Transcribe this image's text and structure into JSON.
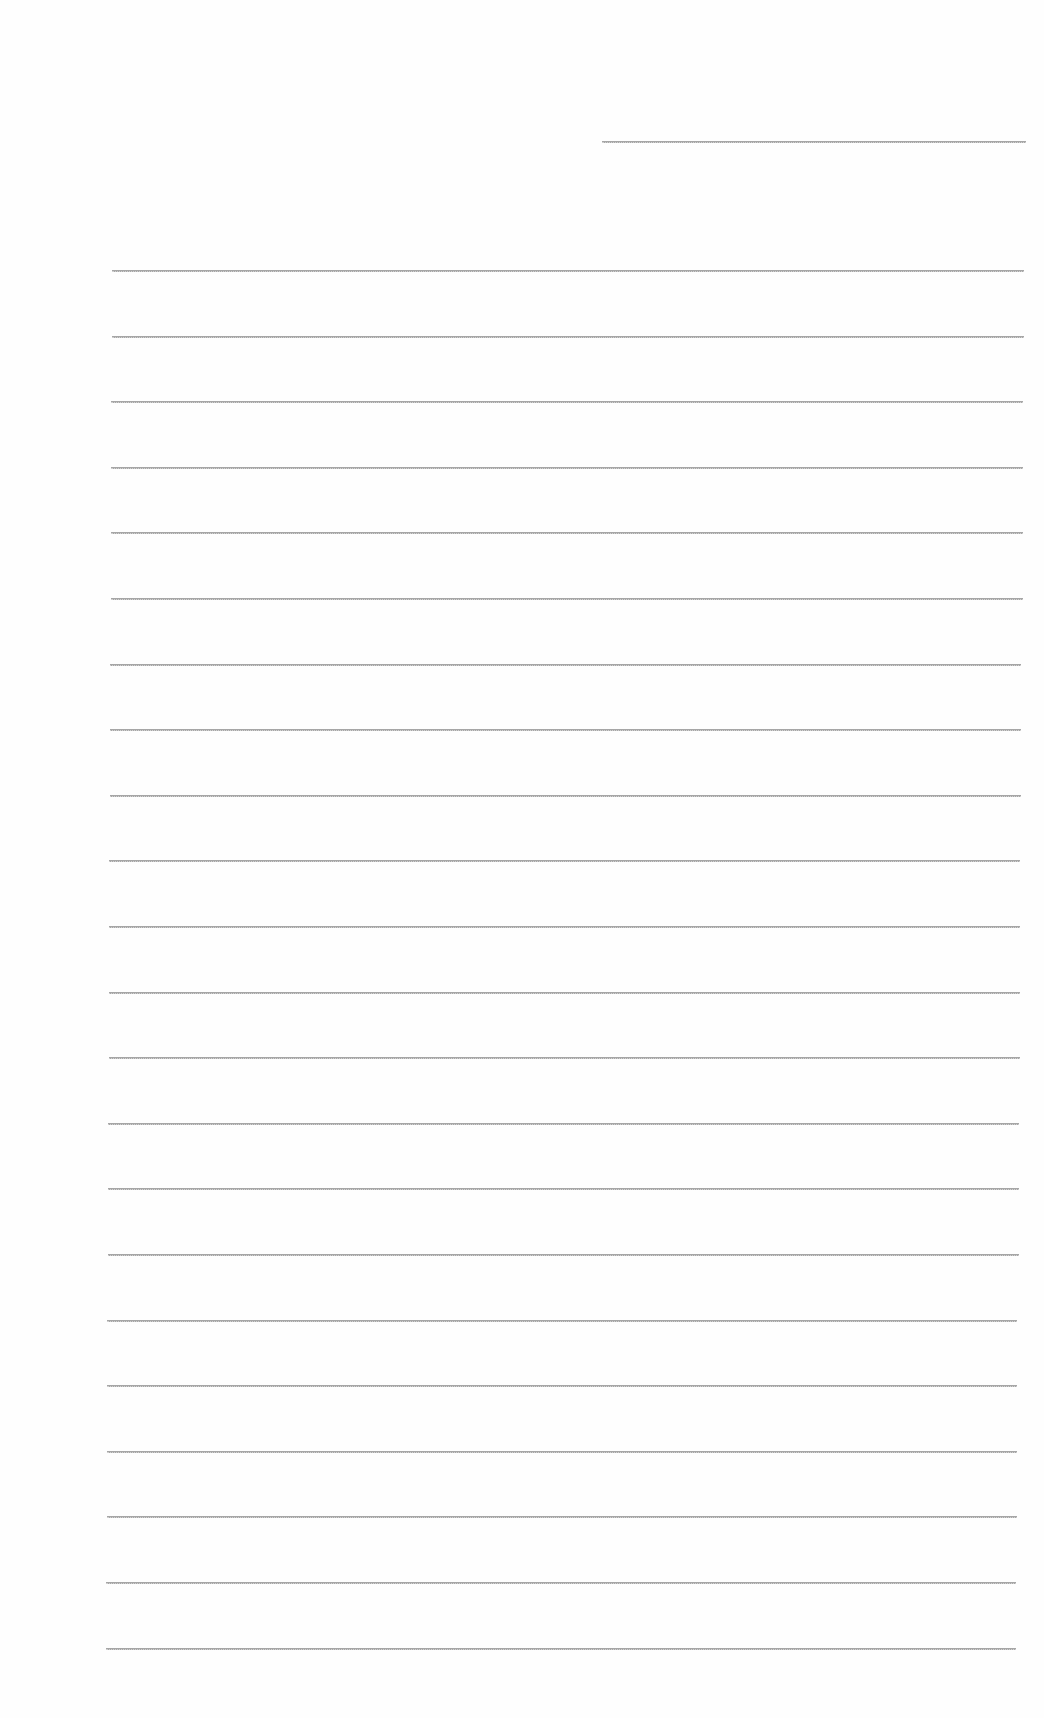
{
  "document": {
    "type": "lined-paper",
    "header_line": {
      "left": 602,
      "right": 1026,
      "y": 141
    },
    "ruled_lines": {
      "count": 22,
      "first_y": 270,
      "spacing": 65.6,
      "left_top": 112,
      "left_bottom": 106,
      "right_top": 1024,
      "right_bottom": 1016
    },
    "line_color": "#a6a6a6",
    "background_color": "#fefefe"
  }
}
